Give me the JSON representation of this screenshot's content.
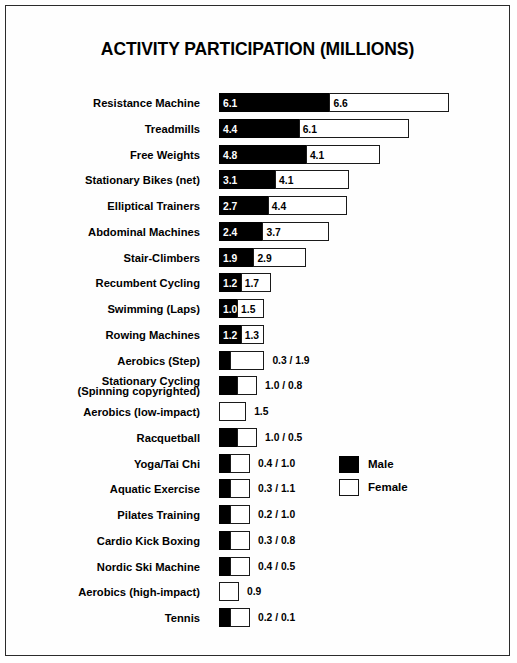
{
  "chart_data": {
    "type": "bar",
    "title": "ACTIVITY PARTICIPATION (MILLIONS)",
    "subtype": "stacked-horizontal",
    "xlabel": "",
    "ylabel": "",
    "grid": false,
    "legend_position": "center-right",
    "units": "millions",
    "px_per_unit": 18.1,
    "bar_origin_px": 213,
    "categories": [
      "Resistance Machine",
      "Treadmills",
      "Free Weights",
      "Stationary Bikes (net)",
      "Elliptical Trainers",
      "Abdominal Machines",
      "Stair-Climbers",
      "Recumbent Cycling",
      "Swimming (Laps)",
      "Rowing Machines",
      "Aerobics (Step)",
      "Stationary Cycling (Spinning copyrighted)",
      "Aerobics (low-impact)",
      "Racquetball",
      "Yoga/Tai Chi",
      "Aquatic Exercise",
      "Pilates Training",
      "Cardio Kick Boxing",
      "Nordic Ski Machine",
      "Aerobics (high-impact)",
      "Tennis"
    ],
    "series": [
      {
        "name": "Male",
        "color": "#000000",
        "values": [
          6.1,
          4.4,
          4.8,
          3.1,
          2.7,
          2.4,
          1.9,
          1.2,
          1.0,
          1.2,
          0.3,
          1.0,
          0.0,
          1.0,
          0.4,
          0.3,
          0.2,
          0.3,
          0.4,
          0.0,
          0.2
        ]
      },
      {
        "name": "Female",
        "color": "#ffffff",
        "values": [
          6.6,
          6.1,
          4.1,
          4.1,
          4.4,
          3.7,
          2.9,
          1.7,
          1.5,
          1.3,
          1.9,
          0.8,
          1.5,
          0.5,
          1.0,
          1.1,
          1.0,
          0.8,
          0.5,
          0.9,
          0.1
        ]
      }
    ],
    "rows": [
      {
        "label": "Resistance Machine",
        "two_line": false,
        "male": 6.1,
        "female": 6.6,
        "male_text": "6.1",
        "female_text": "6.6",
        "labels_inside": true,
        "outside_text": ""
      },
      {
        "label": "Treadmills",
        "two_line": false,
        "male": 4.4,
        "female": 6.1,
        "male_text": "4.4",
        "female_text": "6.1",
        "labels_inside": true,
        "outside_text": ""
      },
      {
        "label": "Free Weights",
        "two_line": false,
        "male": 4.8,
        "female": 4.1,
        "male_text": "4.8",
        "female_text": "4.1",
        "labels_inside": true,
        "outside_text": ""
      },
      {
        "label": "Stationary Bikes (net)",
        "two_line": false,
        "male": 3.1,
        "female": 4.1,
        "male_text": "3.1",
        "female_text": "4.1",
        "labels_inside": true,
        "outside_text": ""
      },
      {
        "label": "Elliptical Trainers",
        "two_line": false,
        "male": 2.7,
        "female": 4.4,
        "male_text": "2.7",
        "female_text": "4.4",
        "labels_inside": true,
        "outside_text": ""
      },
      {
        "label": "Abdominal Machines",
        "two_line": false,
        "male": 2.4,
        "female": 3.7,
        "male_text": "2.4",
        "female_text": "3.7",
        "labels_inside": true,
        "outside_text": ""
      },
      {
        "label": "Stair-Climbers",
        "two_line": false,
        "male": 1.9,
        "female": 2.9,
        "male_text": "1.9",
        "female_text": "2.9",
        "labels_inside": true,
        "outside_text": ""
      },
      {
        "label": "Recumbent Cycling",
        "two_line": false,
        "male": 1.2,
        "female": 1.7,
        "male_text": "1.2",
        "female_text": "1.7",
        "labels_inside": true,
        "outside_text": ""
      },
      {
        "label": "Swimming (Laps)",
        "two_line": false,
        "male": 1.0,
        "female": 1.5,
        "male_text": "1.0",
        "female_text": "1.5",
        "labels_inside": true,
        "outside_text": ""
      },
      {
        "label": "Rowing Machines",
        "two_line": false,
        "male": 1.2,
        "female": 1.3,
        "male_text": "1.2",
        "female_text": "1.3",
        "labels_inside": true,
        "outside_text": ""
      },
      {
        "label": "Aerobics (Step)",
        "two_line": false,
        "male": 0.3,
        "female": 1.9,
        "male_text": "",
        "female_text": "",
        "labels_inside": false,
        "outside_text": "0.3 / 1.9"
      },
      {
        "label": "Stationary Cycling (Spinning copyrighted)",
        "line1": "Stationary Cycling",
        "line2": "(Spinning copyrighted)",
        "two_line": true,
        "male": 1.0,
        "female": 0.8,
        "male_text": "",
        "female_text": "",
        "labels_inside": false,
        "outside_text": "1.0 / 0.8"
      },
      {
        "label": "Aerobics (low-impact)",
        "two_line": false,
        "male": 0.0,
        "female": 1.5,
        "male_text": "",
        "female_text": "",
        "labels_inside": false,
        "outside_text": "1.5"
      },
      {
        "label": "Racquetball",
        "two_line": false,
        "male": 1.0,
        "female": 0.5,
        "male_text": "",
        "female_text": "",
        "labels_inside": false,
        "outside_text": "1.0 / 0.5"
      },
      {
        "label": "Yoga/Tai Chi",
        "two_line": false,
        "male": 0.4,
        "female": 1.0,
        "male_text": "",
        "female_text": "",
        "labels_inside": false,
        "outside_text": "0.4 / 1.0"
      },
      {
        "label": "Aquatic Exercise",
        "two_line": false,
        "male": 0.3,
        "female": 1.1,
        "male_text": "",
        "female_text": "",
        "labels_inside": false,
        "outside_text": "0.3 / 1.1"
      },
      {
        "label": "Pilates Training",
        "two_line": false,
        "male": 0.2,
        "female": 1.0,
        "male_text": "",
        "female_text": "",
        "labels_inside": false,
        "outside_text": "0.2 / 1.0"
      },
      {
        "label": "Cardio Kick Boxing",
        "two_line": false,
        "male": 0.3,
        "female": 0.8,
        "male_text": "",
        "female_text": "",
        "labels_inside": false,
        "outside_text": "0.3 / 0.8"
      },
      {
        "label": "Nordic Ski Machine",
        "two_line": false,
        "male": 0.4,
        "female": 0.5,
        "male_text": "",
        "female_text": "",
        "labels_inside": false,
        "outside_text": "0.4 / 0.5"
      },
      {
        "label": "Aerobics (high-impact)",
        "two_line": false,
        "male": 0.0,
        "female": 0.9,
        "male_text": "",
        "female_text": "",
        "labels_inside": false,
        "outside_text": "0.9"
      },
      {
        "label": "Tennis",
        "two_line": false,
        "male": 0.2,
        "female": 0.1,
        "male_text": "",
        "female_text": "",
        "labels_inside": false,
        "outside_text": "0.2 / 0.1"
      }
    ],
    "legend": [
      {
        "name": "Male",
        "color": "#000000"
      },
      {
        "name": "Female",
        "color": "#ffffff"
      }
    ]
  }
}
